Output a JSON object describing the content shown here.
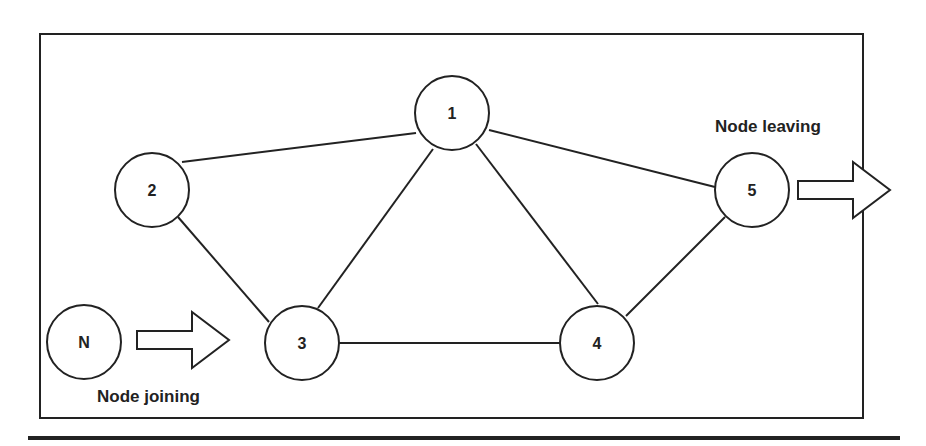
{
  "diagram": {
    "type": "network-topology",
    "colors": {
      "stroke": "#222222",
      "background": "#ffffff"
    },
    "nodes": [
      {
        "id": "1",
        "label": "1",
        "x": 452,
        "y": 113
      },
      {
        "id": "2",
        "label": "2",
        "x": 152,
        "y": 190
      },
      {
        "id": "3",
        "label": "3",
        "x": 302,
        "y": 343
      },
      {
        "id": "4",
        "label": "4",
        "x": 597,
        "y": 343
      },
      {
        "id": "5",
        "label": "5",
        "x": 752,
        "y": 190
      },
      {
        "id": "N",
        "label": "N",
        "x": 84,
        "y": 342
      }
    ],
    "edges": [
      [
        "2",
        "1"
      ],
      [
        "1",
        "5"
      ],
      [
        "2",
        "3"
      ],
      [
        "1",
        "3"
      ],
      [
        "1",
        "4"
      ],
      [
        "3",
        "4"
      ],
      [
        "4",
        "5"
      ]
    ],
    "annotations": {
      "joining": {
        "label": "Node joining",
        "arrow": "right-arrow"
      },
      "leaving": {
        "label": "Node leaving",
        "arrow": "right-arrow"
      }
    }
  }
}
